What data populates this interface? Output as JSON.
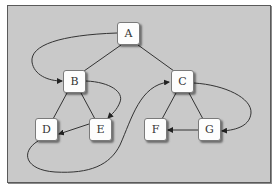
{
  "diagram": {
    "type": "graph",
    "background": "#c9c9c9",
    "nodes": [
      {
        "id": "A",
        "label": "A",
        "x": 117,
        "y": 22
      },
      {
        "id": "B",
        "label": "B",
        "x": 63,
        "y": 70
      },
      {
        "id": "C",
        "label": "C",
        "x": 171,
        "y": 70
      },
      {
        "id": "D",
        "label": "D",
        "x": 35,
        "y": 118
      },
      {
        "id": "E",
        "label": "E",
        "x": 89,
        "y": 118
      },
      {
        "id": "F",
        "label": "F",
        "x": 144,
        "y": 118
      },
      {
        "id": "G",
        "label": "G",
        "x": 198,
        "y": 118
      }
    ],
    "tree_edges": [
      {
        "from": "A",
        "to": "B"
      },
      {
        "from": "A",
        "to": "C"
      },
      {
        "from": "B",
        "to": "D"
      },
      {
        "from": "B",
        "to": "E"
      },
      {
        "from": "C",
        "to": "F"
      },
      {
        "from": "C",
        "to": "G"
      }
    ],
    "directed_edges": [
      {
        "from": "A",
        "to": "B",
        "curved": true
      },
      {
        "from": "B",
        "to": "E",
        "curved": true
      },
      {
        "from": "E",
        "to": "D",
        "curved": false
      },
      {
        "from": "D",
        "to": "C",
        "curved": true
      },
      {
        "from": "C",
        "to": "G",
        "curved": true
      },
      {
        "from": "G",
        "to": "F",
        "curved": false
      }
    ]
  }
}
